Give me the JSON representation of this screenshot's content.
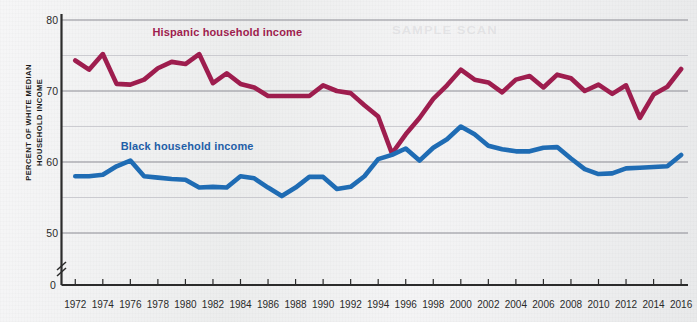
{
  "figure": {
    "background_color": "#f0f0f1",
    "watermark_text": "SAMPLE SCAN"
  },
  "chart_data": {
    "type": "line",
    "title": "",
    "xlabel": "",
    "ylabel": "PERCENT OF WHITE MEDIAN HOUSEHOLD INCOME",
    "ylabel_line1": "PERCENT OF WHITE MEDIAN",
    "ylabel_line2": "HOUSEHOLD INCOME",
    "xlim": [
      1971,
      2016.5
    ],
    "ylim": [
      48.5,
      80
    ],
    "axis_break": true,
    "origin_label": "0",
    "grid": true,
    "grid_major_color": "#8b8b93",
    "grid_minor_color": "#c2c2c8",
    "legend_position": "inline-annotations",
    "y_ticks": [
      80,
      70,
      60,
      50
    ],
    "y_tick_labels": [
      "80",
      "70",
      "60",
      "50"
    ],
    "y_minor_ticks": [
      75,
      65,
      55
    ],
    "x_ticks": [
      1972,
      1974,
      1976,
      1978,
      1980,
      1982,
      1984,
      1986,
      1988,
      1990,
      1992,
      1994,
      1996,
      1998,
      2000,
      2002,
      2004,
      2006,
      2008,
      2010,
      2012,
      2014,
      2016
    ],
    "x_tick_labels": [
      "1972",
      "1974",
      "1976",
      "1978",
      "1980",
      "1982",
      "1984",
      "1986",
      "1988",
      "1990",
      "1992",
      "1994",
      "1996",
      "1998",
      "2000",
      "2002",
      "2004",
      "2006",
      "2008",
      "2010",
      "2012",
      "2014",
      "2016"
    ],
    "x": [
      1972,
      1973,
      1974,
      1975,
      1976,
      1977,
      1978,
      1979,
      1980,
      1981,
      1982,
      1983,
      1984,
      1985,
      1986,
      1987,
      1988,
      1989,
      1990,
      1991,
      1992,
      1993,
      1994,
      1995,
      1996,
      1997,
      1998,
      1999,
      2000,
      2001,
      2002,
      2003,
      2004,
      2005,
      2006,
      2007,
      2008,
      2009,
      2010,
      2011,
      2012,
      2013,
      2014,
      2015,
      2016
    ],
    "series": [
      {
        "name": "Hispanic household income",
        "label": "Hispanic household income",
        "color": "#9e1d4e",
        "label_color": "#9e1d4e",
        "label_x": 1977.6,
        "label_y": 78.2,
        "values": [
          74.3,
          73.0,
          75.2,
          71.0,
          70.9,
          71.6,
          73.2,
          74.1,
          73.8,
          75.2,
          71.1,
          72.5,
          71.0,
          70.5,
          69.3,
          69.3,
          69.3,
          69.3,
          70.8,
          70.0,
          69.7,
          68.0,
          66.4,
          61.2,
          63.9,
          66.2,
          68.9,
          70.8,
          73.0,
          71.6,
          71.2,
          69.8,
          71.6,
          72.1,
          70.5,
          72.3,
          71.8,
          70.0,
          70.9,
          69.6,
          70.8,
          66.2,
          69.5,
          70.6,
          73.1
        ]
      },
      {
        "name": "Black household income",
        "label": "Black household income",
        "color": "#1f6cb4",
        "label_color": "#1f5fa8",
        "label_x": 1975.3,
        "label_y": 62.1,
        "values": [
          58.0,
          58.0,
          58.2,
          59.4,
          60.2,
          58.0,
          57.8,
          57.6,
          57.5,
          56.4,
          56.5,
          56.4,
          58.0,
          57.7,
          56.4,
          55.2,
          56.4,
          57.9,
          57.9,
          56.2,
          56.5,
          58.0,
          60.4,
          61.0,
          61.9,
          60.2,
          62.0,
          63.2,
          65.0,
          63.9,
          62.3,
          61.8,
          61.5,
          61.5,
          62.0,
          62.1,
          60.5,
          59.0,
          58.3,
          58.4,
          59.1,
          59.2,
          59.3,
          59.4,
          61.0
        ]
      }
    ]
  }
}
